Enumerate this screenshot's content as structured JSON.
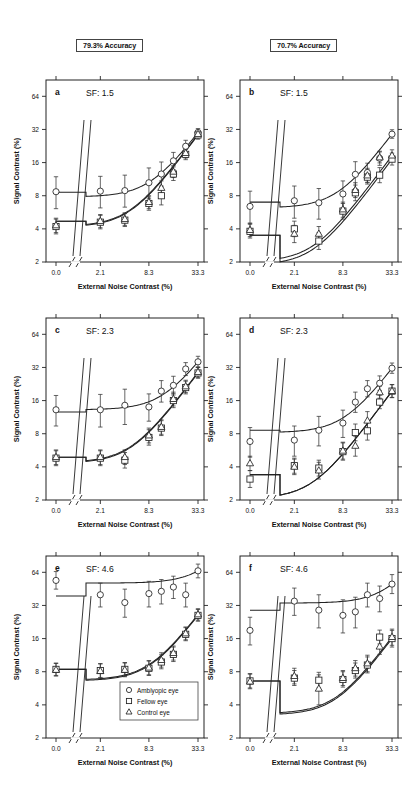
{
  "figure": {
    "columns": [
      {
        "id": "col-793",
        "header": "79.3% Accuracy"
      },
      {
        "id": "col-707",
        "header": "70.7% Accuracy"
      }
    ],
    "axis": {
      "xlabel": "External Noise Contrast (%)",
      "ylabel": "Signal Contrast (%)",
      "xticks": [
        "0.0",
        "2.1",
        "8.3",
        "33.3"
      ],
      "yticks": [
        "2",
        "4",
        "8",
        "16",
        "32",
        "64"
      ]
    },
    "legend": {
      "items": [
        {
          "marker": "circle-icon",
          "label": "Amblyopic eye"
        },
        {
          "marker": "square-icon",
          "label": "Fellow eye"
        },
        {
          "marker": "triangle-icon",
          "label": "Control eye"
        }
      ]
    }
  },
  "chart_data": {
    "type": "scatter",
    "xlabel": "External Noise Contrast (%)",
    "ylabel": "Signal Contrast (%)",
    "xscale": "log-with-break",
    "yscale": "log2",
    "ylim": [
      2,
      90
    ],
    "xtick_values": [
      0.0,
      2.1,
      8.3,
      33.3
    ],
    "ytick_values": [
      2,
      4,
      8,
      16,
      32,
      64
    ],
    "grid": false,
    "legend_position": "inside-panel-e-bottom-right",
    "panels": [
      {
        "letter": "a",
        "accuracy": "79.3% Accuracy",
        "sf_label": "SF: 1.5",
        "sf": 1.5,
        "series": [
          {
            "name": "Amblyopic eye",
            "marker": "circle",
            "x": [
              0.0,
              2.1,
              4.2,
              8.3,
              11.8,
              16.6,
              23.5,
              33.3
            ],
            "y": [
              8.7,
              8.8,
              8.9,
              10.5,
              12.6,
              16.6,
              22.5,
              30.0
            ],
            "err_lo": [
              2.6,
              2.6,
              2.6,
              3.0,
              3.0,
              2.8,
              2.6,
              2.6
            ],
            "err_hi": [
              3.2,
              3.2,
              3.4,
              3.8,
              3.6,
              3.2,
              3.0,
              2.6
            ],
            "fit_asymptote": 8.6
          },
          {
            "name": "Fellow eye",
            "marker": "square",
            "x": [
              0.0,
              2.1,
              4.2,
              8.3,
              11.8,
              16.6,
              23.5,
              33.3
            ],
            "y": [
              4.2,
              4.6,
              4.8,
              6.8,
              8.0,
              12.6,
              19.0,
              28.5
            ],
            "err_lo": [
              0.6,
              0.6,
              0.6,
              0.9,
              1.4,
              1.6,
              2.0,
              2.4
            ],
            "err_hi": [
              0.7,
              0.7,
              0.7,
              1.0,
              1.8,
              2.0,
              2.4,
              2.6
            ],
            "fit_asymptote": 4.7
          },
          {
            "name": "Control eye",
            "marker": "triangle",
            "x": [
              0.0,
              2.1,
              4.2,
              8.3,
              11.8,
              16.6,
              23.5,
              33.3
            ],
            "y": [
              4.3,
              4.7,
              4.9,
              7.0,
              9.4,
              13.2,
              19.5,
              29.0
            ],
            "err_lo": [
              0.6,
              0.6,
              0.6,
              0.9,
              1.2,
              1.5,
              1.9,
              2.2
            ],
            "err_hi": [
              0.7,
              0.7,
              0.7,
              1.0,
              1.5,
              1.8,
              2.2,
              2.5
            ],
            "fit_asymptote": 4.7
          }
        ]
      },
      {
        "letter": "b",
        "accuracy": "70.7% Accuracy",
        "sf_label": "SF: 1.5",
        "sf": 1.5,
        "series": [
          {
            "name": "Amblyopic eye",
            "marker": "circle",
            "x": [
              0.0,
              2.1,
              4.2,
              8.3,
              11.8,
              16.6,
              23.5,
              33.3
            ],
            "y": [
              6.4,
              7.2,
              6.9,
              8.3,
              12.5,
              13.0,
              17.5,
              29.0
            ],
            "err_lo": [
              1.9,
              2.2,
              2.0,
              2.1,
              3.2,
              2.4,
              2.4,
              2.4
            ],
            "err_hi": [
              2.4,
              2.6,
              2.4,
              2.6,
              3.8,
              2.8,
              2.8,
              2.8
            ],
            "fit_asymptote": 7.0
          },
          {
            "name": "Fellow eye",
            "marker": "square",
            "x": [
              0.0,
              2.1,
              4.2,
              8.3,
              11.8,
              16.6,
              23.5,
              33.3
            ],
            "y": [
              3.8,
              4.0,
              3.1,
              5.8,
              8.5,
              11.8,
              12.3,
              17.2
            ],
            "err_lo": [
              0.5,
              0.6,
              0.5,
              0.9,
              1.3,
              1.6,
              1.8,
              2.0
            ],
            "err_hi": [
              0.6,
              0.7,
              0.6,
              1.0,
              1.5,
              1.9,
              2.1,
              2.3
            ],
            "fit_asymptote": 3.5
          },
          {
            "name": "Control eye",
            "marker": "triangle",
            "x": [
              0.0,
              2.1,
              4.2,
              8.3,
              11.8,
              16.6,
              23.5,
              33.3
            ],
            "y": [
              3.9,
              3.6,
              3.6,
              6.0,
              9.0,
              12.2,
              17.8,
              18.5
            ],
            "err_lo": [
              0.5,
              0.6,
              0.5,
              0.9,
              1.3,
              1.7,
              1.9,
              2.1
            ],
            "err_hi": [
              0.6,
              0.7,
              0.6,
              1.0,
              1.5,
              2.0,
              2.2,
              2.4
            ],
            "fit_asymptote": 3.5
          }
        ]
      },
      {
        "letter": "c",
        "accuracy": "79.3% Accuracy",
        "sf_label": "SF: 2.3",
        "sf": 2.3,
        "series": [
          {
            "name": "Amblyopic eye",
            "marker": "circle",
            "x": [
              0.0,
              2.1,
              4.2,
              8.3,
              11.8,
              16.6,
              23.5,
              33.3
            ],
            "y": [
              13.2,
              13.2,
              14.5,
              14.0,
              19.5,
              22.0,
              31.0,
              36.0
            ],
            "err_lo": [
              3.8,
              4.0,
              4.8,
              3.6,
              4.0,
              4.0,
              4.0,
              4.0
            ],
            "err_hi": [
              4.6,
              5.0,
              5.8,
              4.4,
              4.8,
              4.6,
              4.4,
              4.4
            ],
            "fit_asymptote": 12.6
          },
          {
            "name": "Fellow eye",
            "marker": "square",
            "x": [
              0.0,
              2.1,
              4.2,
              8.3,
              11.8,
              16.6,
              23.5,
              33.3
            ],
            "y": [
              4.8,
              4.8,
              4.6,
              7.4,
              9.0,
              16.0,
              21.0,
              28.5
            ],
            "err_lo": [
              0.7,
              0.7,
              0.7,
              1.1,
              1.3,
              2.2,
              2.6,
              3.0
            ],
            "err_hi": [
              0.8,
              0.8,
              0.8,
              1.3,
              1.5,
              2.6,
              3.0,
              3.4
            ],
            "fit_asymptote": 4.9
          },
          {
            "name": "Control eye",
            "marker": "triangle",
            "x": [
              0.0,
              2.1,
              4.2,
              8.3,
              11.8,
              16.6,
              23.5,
              33.3
            ],
            "y": [
              4.9,
              4.9,
              4.9,
              7.7,
              9.2,
              16.5,
              21.5,
              29.0
            ],
            "err_lo": [
              0.7,
              0.7,
              0.7,
              1.1,
              1.3,
              2.2,
              2.6,
              3.0
            ],
            "err_hi": [
              0.8,
              0.8,
              0.8,
              1.3,
              1.5,
              2.6,
              3.0,
              3.4
            ],
            "fit_asymptote": 4.9
          }
        ]
      },
      {
        "letter": "d",
        "accuracy": "70.7% Accuracy",
        "sf_label": "SF: 2.3",
        "sf": 2.3,
        "series": [
          {
            "name": "Amblyopic eye",
            "marker": "circle",
            "x": [
              0.0,
              2.1,
              4.2,
              8.3,
              11.8,
              16.6,
              23.5,
              33.3
            ],
            "y": [
              6.8,
              7.0,
              8.6,
              10.0,
              15.5,
              20.5,
              23.0,
              31.5
            ],
            "err_lo": [
              1.9,
              2.0,
              2.4,
              2.6,
              3.0,
              3.2,
              3.2,
              3.2
            ],
            "err_hi": [
              2.3,
              2.4,
              2.9,
              3.1,
              3.6,
              3.8,
              3.8,
              3.6
            ],
            "fit_asymptote": 8.6
          },
          {
            "name": "Fellow eye",
            "marker": "square",
            "x": [
              0.0,
              2.1,
              4.2,
              8.3,
              11.8,
              16.6,
              23.5,
              33.3
            ],
            "y": [
              3.1,
              4.1,
              3.9,
              5.5,
              8.2,
              8.5,
              15.5,
              19.5
            ],
            "err_lo": [
              0.5,
              0.6,
              0.6,
              0.9,
              1.3,
              1.5,
              2.0,
              2.4
            ],
            "err_hi": [
              0.6,
              0.7,
              0.7,
              1.1,
              1.6,
              1.8,
              2.4,
              2.8
            ],
            "fit_asymptote": 3.4
          },
          {
            "name": "Control eye",
            "marker": "triangle",
            "x": [
              0.0,
              2.1,
              4.2,
              8.3,
              11.8,
              16.6,
              23.5,
              33.3
            ],
            "y": [
              4.3,
              4.0,
              3.7,
              5.6,
              6.2,
              10.5,
              19.0,
              19.5
            ],
            "err_lo": [
              0.6,
              0.6,
              0.6,
              0.9,
              1.2,
              1.8,
              2.2,
              2.5
            ],
            "err_hi": [
              0.7,
              0.7,
              0.7,
              1.1,
              1.4,
              2.2,
              2.6,
              2.9
            ],
            "fit_asymptote": 3.4
          }
        ]
      },
      {
        "letter": "e",
        "accuracy": "79.3% Accuracy",
        "sf_label": "SF: 4.6",
        "sf": 4.6,
        "series": [
          {
            "name": "Amblyopic eye",
            "marker": "circle",
            "x": [
              0.0,
              2.1,
              4.2,
              8.3,
              11.8,
              16.6,
              23.5,
              33.3
            ],
            "y": [
              54.0,
              40.0,
              34.0,
              41.0,
              43.0,
              47.0,
              40.0,
              66.0
            ],
            "err_lo": [
              9.0,
              9.0,
              9.0,
              10.0,
              10.0,
              10.0,
              9.0,
              9.0
            ],
            "err_hi": [
              11.0,
              11.0,
              11.0,
              12.0,
              12.0,
              12.0,
              11.0,
              10.0
            ],
            "fit_asymptote": 39.0
          },
          {
            "name": "Fellow eye",
            "marker": "square",
            "x": [
              0.0,
              2.1,
              4.2,
              8.3,
              11.8,
              16.6,
              23.5,
              33.3
            ],
            "y": [
              8.4,
              8.2,
              8.4,
              8.6,
              9.8,
              11.5,
              17.5,
              26.0
            ],
            "err_lo": [
              1.0,
              1.1,
              1.1,
              1.2,
              1.3,
              1.6,
              2.2,
              3.0
            ],
            "err_hi": [
              1.2,
              1.3,
              1.3,
              1.4,
              1.6,
              1.9,
              2.6,
              3.4
            ],
            "fit_asymptote": 8.4
          },
          {
            "name": "Control eye",
            "marker": "triangle",
            "x": [
              0.0,
              2.1,
              4.2,
              8.3,
              11.8,
              16.6,
              23.5,
              33.3
            ],
            "y": [
              8.3,
              8.1,
              8.3,
              8.7,
              10.2,
              11.8,
              17.8,
              26.5
            ],
            "err_lo": [
              1.0,
              1.1,
              1.1,
              1.2,
              1.4,
              1.6,
              2.2,
              3.0
            ],
            "err_hi": [
              1.2,
              1.3,
              1.3,
              1.4,
              1.7,
              1.9,
              2.6,
              3.4
            ],
            "fit_asymptote": 8.4
          }
        ]
      },
      {
        "letter": "f",
        "accuracy": "70.7% Accuracy",
        "sf_label": "SF: 4.6",
        "sf": 4.6,
        "series": [
          {
            "name": "Amblyopic eye",
            "marker": "circle",
            "x": [
              0.0,
              2.1,
              4.2,
              8.3,
              11.8,
              16.6,
              23.5,
              33.3
            ],
            "y": [
              19.0,
              35.0,
              29.0,
              26.0,
              28.0,
              40.0,
              37.0,
              50.0
            ],
            "err_lo": [
              5.0,
              9.0,
              9.0,
              8.0,
              8.0,
              9.0,
              9.0,
              9.0
            ],
            "err_hi": [
              6.0,
              11.0,
              11.0,
              10.0,
              10.0,
              11.0,
              11.0,
              11.0
            ],
            "fit_asymptote": 29.0
          },
          {
            "name": "Fellow eye",
            "marker": "square",
            "x": [
              0.0,
              2.1,
              4.2,
              8.3,
              11.8,
              16.6,
              23.5,
              33.3
            ],
            "y": [
              6.6,
              7.0,
              6.7,
              6.8,
              8.2,
              9.2,
              16.5,
              16.0
            ],
            "err_lo": [
              0.9,
              1.0,
              1.0,
              1.0,
              1.2,
              1.4,
              2.2,
              2.6
            ],
            "err_hi": [
              1.1,
              1.2,
              1.2,
              1.2,
              1.4,
              1.7,
              2.6,
              3.0
            ],
            "fit_asymptote": 6.6
          },
          {
            "name": "Control eye",
            "marker": "triangle",
            "x": [
              0.0,
              2.1,
              4.2,
              8.3,
              11.8,
              16.6,
              23.5,
              33.3
            ],
            "y": [
              6.5,
              7.3,
              5.6,
              7.0,
              8.6,
              9.5,
              13.5,
              16.5
            ],
            "err_lo": [
              0.9,
              1.1,
              1.6,
              1.0,
              1.3,
              1.5,
              2.0,
              2.6
            ],
            "err_hi": [
              1.1,
              1.3,
              1.9,
              1.2,
              1.5,
              1.8,
              2.4,
              3.0
            ],
            "fit_asymptote": 6.6
          }
        ]
      }
    ]
  }
}
